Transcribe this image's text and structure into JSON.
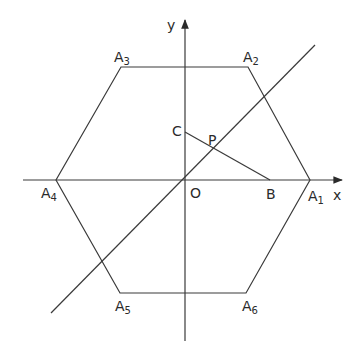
{
  "diagram": {
    "type": "geometry",
    "colors": {
      "stroke": "#3a3a3a",
      "text": "#2a2a2a",
      "background": "#ffffff"
    },
    "axes": {
      "x_label": "x",
      "y_label": "y"
    },
    "points": {
      "O": {
        "label": "O",
        "x": 185,
        "y": 180
      },
      "A1": {
        "label": "A",
        "sub": "1",
        "x": 310,
        "y": 180
      },
      "A2": {
        "label": "A",
        "sub": "2",
        "x": 248,
        "y": 67
      },
      "A3": {
        "label": "A",
        "sub": "3",
        "x": 121,
        "y": 67
      },
      "A4": {
        "label": "A",
        "sub": "4",
        "x": 56,
        "y": 180
      },
      "A5": {
        "label": "A",
        "sub": "5",
        "x": 120,
        "y": 293
      },
      "A6": {
        "label": "A",
        "sub": "6",
        "x": 246,
        "y": 293
      },
      "B": {
        "label": "B",
        "x": 270,
        "y": 180
      },
      "C": {
        "label": "C",
        "x": 185,
        "y": 132
      },
      "P": {
        "label": "P",
        "x": 215,
        "y": 150
      }
    },
    "segments": [
      {
        "name": "hexagon",
        "points": [
          "A1",
          "A2",
          "A3",
          "A4",
          "A5",
          "A6"
        ]
      },
      {
        "name": "CB",
        "from": "C",
        "to": "B"
      },
      {
        "name": "line-through-O",
        "from": [
          51,
          313
        ],
        "to": [
          315,
          45
        ]
      }
    ]
  }
}
